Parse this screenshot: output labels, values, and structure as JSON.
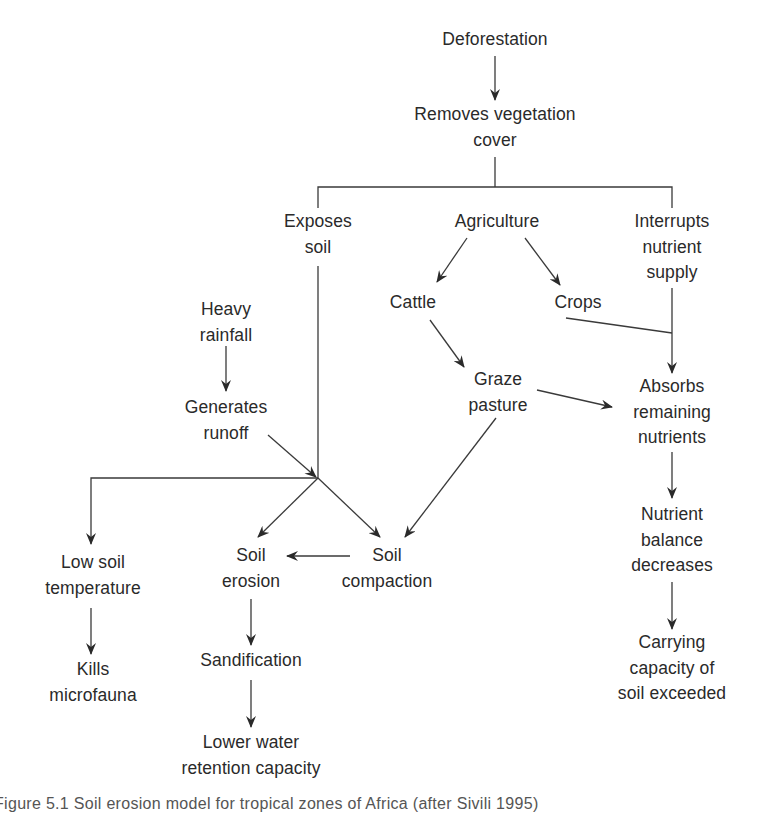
{
  "figure": {
    "caption": "Figure 5.1  Soil erosion model for tropical zones of Africa (after Sivili 1995)",
    "colors": {
      "line": "#3a3a3a",
      "text": "#2a2a2a",
      "background": "#ffffff"
    }
  },
  "nodes": {
    "deforestation": [
      "Deforestation"
    ],
    "removes_vegetation": [
      "Removes vegetation",
      "cover"
    ],
    "exposes_soil": [
      "Exposes",
      "soil"
    ],
    "agriculture": [
      "Agriculture"
    ],
    "interrupts_nutrient": [
      "Interrupts",
      "nutrient",
      "supply"
    ],
    "cattle": [
      "Cattle"
    ],
    "crops": [
      "Crops"
    ],
    "heavy_rainfall": [
      "Heavy",
      "rainfall"
    ],
    "generates_runoff": [
      "Generates",
      "runoff"
    ],
    "graze_pasture": [
      "Graze",
      "pasture"
    ],
    "absorbs_nutrients": [
      "Absorbs",
      "remaining",
      "nutrients"
    ],
    "low_soil_temperature": [
      "Low soil",
      "temperature"
    ],
    "soil_erosion": [
      "Soil",
      "erosion"
    ],
    "soil_compaction": [
      "Soil",
      "compaction"
    ],
    "nutrient_balance": [
      "Nutrient",
      "balance",
      "decreases"
    ],
    "kills_microfauna": [
      "Kills",
      "microfauna"
    ],
    "sandification": [
      "Sandification"
    ],
    "lower_water_retention": [
      "Lower water",
      "retention capacity"
    ],
    "carrying_capacity": [
      "Carrying",
      "capacity of",
      "soil exceeded"
    ]
  },
  "edges": [
    [
      "Deforestation",
      "Removes vegetation cover"
    ],
    [
      "Removes vegetation cover",
      "Exposes soil"
    ],
    [
      "Removes vegetation cover",
      "Agriculture"
    ],
    [
      "Removes vegetation cover",
      "Interrupts nutrient supply"
    ],
    [
      "Agriculture",
      "Cattle"
    ],
    [
      "Agriculture",
      "Crops"
    ],
    [
      "Cattle",
      "Graze pasture"
    ],
    [
      "Crops",
      "Absorbs remaining nutrients"
    ],
    [
      "Interrupts nutrient supply",
      "Absorbs remaining nutrients"
    ],
    [
      "Graze pasture",
      "Absorbs remaining nutrients"
    ],
    [
      "Graze pasture",
      "Soil compaction"
    ],
    [
      "Heavy rainfall",
      "Generates runoff"
    ],
    [
      "Generates runoff",
      "junction"
    ],
    [
      "Exposes soil",
      "junction"
    ],
    [
      "junction",
      "Low soil temperature"
    ],
    [
      "junction",
      "Soil erosion"
    ],
    [
      "junction",
      "Soil compaction"
    ],
    [
      "Soil compaction",
      "Soil erosion"
    ],
    [
      "Low soil temperature",
      "Kills microfauna"
    ],
    [
      "Soil erosion",
      "Sandification"
    ],
    [
      "Sandification",
      "Lower water retention capacity"
    ],
    [
      "Absorbs remaining nutrients",
      "Nutrient balance decreases"
    ],
    [
      "Nutrient balance decreases",
      "Carrying capacity of soil exceeded"
    ]
  ]
}
